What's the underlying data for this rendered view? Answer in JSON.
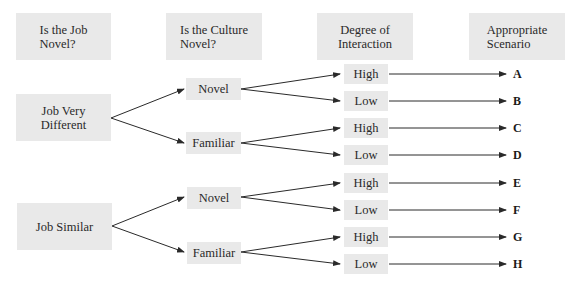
{
  "headers": [
    {
      "line1": "Is the Job",
      "line2": "Novel?"
    },
    {
      "line1": "Is the Culture",
      "line2": "Novel?"
    },
    {
      "line1": "Degree of",
      "line2": "Interaction"
    },
    {
      "line1": "Appropriate",
      "line2": "Scenario"
    }
  ],
  "job_nodes": [
    {
      "line1": "Job Very",
      "line2": "Different"
    },
    {
      "line1": "Job Similar",
      "line2": ""
    }
  ],
  "culture_nodes": [
    {
      "label": "Novel"
    },
    {
      "label": "Familiar"
    },
    {
      "label": "Novel"
    },
    {
      "label": "Familiar"
    }
  ],
  "interaction_nodes": [
    {
      "label": "High"
    },
    {
      "label": "Low"
    },
    {
      "label": "High"
    },
    {
      "label": "Low"
    },
    {
      "label": "High"
    },
    {
      "label": "Low"
    },
    {
      "label": "High"
    },
    {
      "label": "Low"
    }
  ],
  "scenarios": [
    {
      "label": "A"
    },
    {
      "label": "B"
    },
    {
      "label": "C"
    },
    {
      "label": "D"
    },
    {
      "label": "E"
    },
    {
      "label": "F"
    },
    {
      "label": "G"
    },
    {
      "label": "H"
    }
  ],
  "colors": {
    "box_fill": "#e9e9e9",
    "line": "#2a2a2a",
    "text": "#2a2a2a"
  }
}
